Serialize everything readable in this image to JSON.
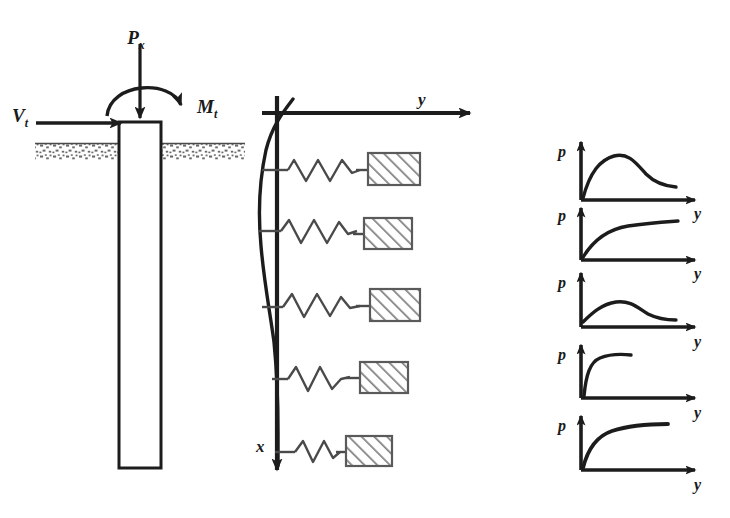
{
  "figure": {
    "stroke_color": "#1c1c1c",
    "soil_color": "#6e6e6e",
    "hatch_color": "#777777"
  },
  "pile": {
    "label": "pile",
    "top_y": 122,
    "bottom_y": 468,
    "left_x": 119,
    "right_x": 161
  },
  "loads": [
    {
      "name": "axial-load",
      "symbol": "P",
      "subscript": "x",
      "label": "Px",
      "type": "vertical-arrow"
    },
    {
      "name": "shear-load",
      "symbol": "V",
      "subscript": "t",
      "label": "Vt",
      "type": "horizontal-arrow"
    },
    {
      "name": "moment-load",
      "symbol": "M",
      "subscript": "t",
      "label": "Mt",
      "type": "curved-arrow"
    }
  ],
  "ground": {
    "label": "ground-surface",
    "y": 143,
    "pattern": "speckled-soil"
  },
  "axes": {
    "horizontal": {
      "name": "y-axis",
      "label": "y",
      "direction": "right",
      "origin_x": 277,
      "origin_y": 113,
      "end_x": 482
    },
    "vertical": {
      "name": "x-axis",
      "label": "x",
      "direction": "down",
      "origin_x": 277,
      "top_y": 96,
      "end_y": 484
    }
  },
  "springs": [
    {
      "index": 1,
      "name": "soil-spring-1",
      "y": 170,
      "coils": 5,
      "block_width": 52
    },
    {
      "index": 2,
      "name": "soil-spring-2",
      "y": 233,
      "coils": 4,
      "block_width": 48
    },
    {
      "index": 3,
      "name": "soil-spring-3",
      "y": 305,
      "coils": 4,
      "block_width": 48
    },
    {
      "index": 4,
      "name": "soil-spring-4",
      "y": 378,
      "coils": 3,
      "block_width": 46
    },
    {
      "index": 5,
      "name": "soil-spring-5",
      "y": 450,
      "coils": 2,
      "block_width": 44
    }
  ],
  "deflection_curve": {
    "name": "pile-deflection-curve",
    "description": "deflected shape of pile, bulging to the left of the x-axis near the surface"
  },
  "py_curves": {
    "ylabel": "p",
    "xlabel": "y",
    "chart_type": "line",
    "curves": [
      {
        "index": 1,
        "name": "py-curve-1",
        "shape": "rise-peak-soften",
        "ylabel": "p",
        "xlabel": "y",
        "x": [
          0,
          0.04,
          0.1,
          0.2,
          0.32,
          0.45,
          0.58,
          0.72,
          0.86,
          1.0
        ],
        "p": [
          0,
          0.3,
          0.5,
          0.68,
          0.78,
          0.74,
          0.63,
          0.52,
          0.45,
          0.42
        ]
      },
      {
        "index": 2,
        "name": "py-curve-2",
        "shape": "hyperbolic-hardening",
        "ylabel": "p",
        "xlabel": "y",
        "x": [
          0,
          0.05,
          0.12,
          0.22,
          0.36,
          0.52,
          0.7,
          0.85,
          1.0
        ],
        "p": [
          0,
          0.3,
          0.48,
          0.6,
          0.68,
          0.72,
          0.75,
          0.77,
          0.79
        ]
      },
      {
        "index": 3,
        "name": "py-curve-3",
        "shape": "low-peak-soften",
        "ylabel": "p",
        "xlabel": "y",
        "x": [
          0,
          0.06,
          0.15,
          0.28,
          0.42,
          0.56,
          0.7,
          0.85,
          1.0
        ],
        "p": [
          0,
          0.16,
          0.3,
          0.43,
          0.45,
          0.4,
          0.32,
          0.26,
          0.24
        ]
      },
      {
        "index": 4,
        "name": "py-curve-4",
        "shape": "steep-rise-short-plateau",
        "ylabel": "p",
        "xlabel": "y",
        "x": [
          0,
          0.02,
          0.05,
          0.1,
          0.17,
          0.24,
          0.3
        ],
        "p": [
          0,
          0.34,
          0.56,
          0.68,
          0.73,
          0.75,
          0.76
        ]
      },
      {
        "index": 5,
        "name": "py-curve-5",
        "shape": "elastic-plastic-plateau",
        "ylabel": "p",
        "xlabel": "y",
        "x": [
          0,
          0.04,
          0.1,
          0.2,
          0.34,
          0.5,
          0.66,
          0.8
        ],
        "p": [
          0,
          0.34,
          0.56,
          0.72,
          0.8,
          0.84,
          0.86,
          0.87
        ]
      }
    ]
  }
}
